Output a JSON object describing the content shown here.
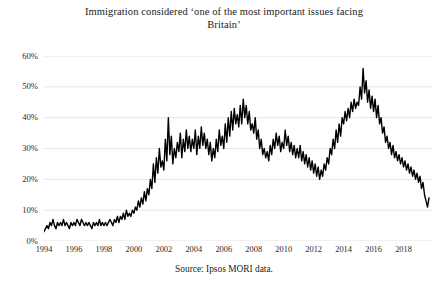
{
  "chart_data": {
    "type": "line",
    "title_line1": "Immigration considered ‘one of the most important issues facing",
    "title_line2": "Britain’",
    "source": "Source: Ipsos MORI data.",
    "xlabel": "",
    "ylabel": "",
    "xlim": [
      1994.0,
      2019.9
    ],
    "ylim": [
      0,
      60
    ],
    "grid": true,
    "legend": null,
    "series_color": "#000000",
    "grid_color": "#e3e3e3",
    "y_ticks": [
      0,
      10,
      20,
      30,
      40,
      50,
      60
    ],
    "y_tick_labels": [
      "0%",
      "10%",
      "20%",
      "30%",
      "40%",
      "50%",
      "60%"
    ],
    "x_ticks": [
      1994,
      1996,
      1998,
      2000,
      2002,
      2004,
      2006,
      2008,
      2010,
      2012,
      2014,
      2016,
      2018
    ],
    "x_tick_labels": [
      "1994",
      "1996",
      "1998",
      "2000",
      "2002",
      "2004",
      "2006",
      "2008",
      "2010",
      "2012",
      "2014",
      "2016",
      "2018"
    ],
    "series": [
      {
        "name": "Immigration as most important issue",
        "x": [
          1994.0,
          1994.1,
          1994.2,
          1994.3,
          1994.4,
          1994.5,
          1994.6,
          1994.7,
          1994.8,
          1994.9,
          1995.0,
          1995.1,
          1995.2,
          1995.3,
          1995.4,
          1995.5,
          1995.6,
          1995.7,
          1995.8,
          1995.9,
          1996.0,
          1996.1,
          1996.2,
          1996.3,
          1996.4,
          1996.5,
          1996.6,
          1996.7,
          1996.8,
          1996.9,
          1997.0,
          1997.1,
          1997.2,
          1997.3,
          1997.4,
          1997.5,
          1997.6,
          1997.7,
          1997.8,
          1997.9,
          1998.0,
          1998.1,
          1998.2,
          1998.3,
          1998.4,
          1998.5,
          1998.6,
          1998.7,
          1998.8,
          1998.9,
          1999.0,
          1999.1,
          1999.2,
          1999.3,
          1999.4,
          1999.5,
          1999.6,
          1999.7,
          1999.8,
          1999.9,
          2000.0,
          2000.1,
          2000.2,
          2000.3,
          2000.4,
          2000.5,
          2000.6,
          2000.7,
          2000.8,
          2000.9,
          2001.0,
          2001.1,
          2001.2,
          2001.3,
          2001.4,
          2001.5,
          2001.6,
          2001.7,
          2001.8,
          2001.9,
          2002.0,
          2002.1,
          2002.2,
          2002.3,
          2002.4,
          2002.5,
          2002.6,
          2002.7,
          2002.8,
          2002.9,
          2003.0,
          2003.1,
          2003.2,
          2003.3,
          2003.4,
          2003.5,
          2003.6,
          2003.7,
          2003.8,
          2003.9,
          2004.0,
          2004.1,
          2004.2,
          2004.3,
          2004.4,
          2004.5,
          2004.6,
          2004.7,
          2004.8,
          2004.9,
          2005.0,
          2005.1,
          2005.2,
          2005.3,
          2005.4,
          2005.5,
          2005.6,
          2005.7,
          2005.8,
          2005.9,
          2006.0,
          2006.1,
          2006.2,
          2006.3,
          2006.4,
          2006.5,
          2006.6,
          2006.7,
          2006.8,
          2006.9,
          2007.0,
          2007.1,
          2007.2,
          2007.3,
          2007.4,
          2007.5,
          2007.6,
          2007.7,
          2007.8,
          2007.9,
          2008.0,
          2008.1,
          2008.2,
          2008.3,
          2008.4,
          2008.5,
          2008.6,
          2008.7,
          2008.8,
          2008.9,
          2009.0,
          2009.1,
          2009.2,
          2009.3,
          2009.4,
          2009.5,
          2009.6,
          2009.7,
          2009.8,
          2009.9,
          2010.0,
          2010.1,
          2010.2,
          2010.3,
          2010.4,
          2010.5,
          2010.6,
          2010.7,
          2010.8,
          2010.9,
          2011.0,
          2011.1,
          2011.2,
          2011.3,
          2011.4,
          2011.5,
          2011.6,
          2011.7,
          2011.8,
          2011.9,
          2012.0,
          2012.1,
          2012.2,
          2012.3,
          2012.4,
          2012.5,
          2012.6,
          2012.7,
          2012.8,
          2012.9,
          2013.0,
          2013.1,
          2013.2,
          2013.3,
          2013.4,
          2013.5,
          2013.6,
          2013.7,
          2013.8,
          2013.9,
          2014.0,
          2014.1,
          2014.2,
          2014.3,
          2014.4,
          2014.5,
          2014.6,
          2014.7,
          2014.8,
          2014.9,
          2015.0,
          2015.1,
          2015.2,
          2015.3,
          2015.4,
          2015.5,
          2015.6,
          2015.7,
          2015.8,
          2015.9,
          2016.0,
          2016.1,
          2016.2,
          2016.3,
          2016.4,
          2016.5,
          2016.6,
          2016.7,
          2016.8,
          2016.9,
          2017.0,
          2017.1,
          2017.2,
          2017.3,
          2017.4,
          2017.5,
          2017.6,
          2017.7,
          2017.8,
          2017.9,
          2018.0,
          2018.1,
          2018.2,
          2018.3,
          2018.4,
          2018.5,
          2018.6,
          2018.7,
          2018.8,
          2018.9,
          2019.0,
          2019.1,
          2019.2,
          2019.3,
          2019.4,
          2019.5,
          2019.6,
          2019.7
        ],
        "values": [
          3,
          4,
          5,
          4,
          6,
          5,
          7,
          5,
          4,
          6,
          5,
          6,
          5,
          7,
          5,
          6,
          5,
          4,
          6,
          5,
          6,
          5,
          7,
          6,
          5,
          7,
          6,
          5,
          6,
          5,
          6,
          5,
          4,
          6,
          5,
          6,
          5,
          7,
          5,
          6,
          5,
          6,
          5,
          6,
          7,
          6,
          5,
          7,
          6,
          8,
          6,
          8,
          7,
          9,
          7,
          10,
          8,
          9,
          8,
          10,
          9,
          11,
          10,
          13,
          11,
          14,
          12,
          16,
          13,
          17,
          15,
          20,
          17,
          25,
          19,
          27,
          22,
          30,
          24,
          26,
          23,
          33,
          26,
          40,
          28,
          34,
          25,
          30,
          27,
          32,
          29,
          35,
          27,
          33,
          29,
          36,
          30,
          34,
          29,
          33,
          30,
          36,
          28,
          34,
          30,
          37,
          31,
          35,
          30,
          33,
          28,
          32,
          26,
          30,
          27,
          33,
          29,
          36,
          31,
          34,
          30,
          38,
          32,
          40,
          34,
          42,
          36,
          43,
          38,
          41,
          37,
          44,
          38,
          46,
          40,
          44,
          38,
          42,
          36,
          38,
          35,
          40,
          33,
          36,
          30,
          33,
          28,
          30,
          27,
          29,
          26,
          31,
          28,
          33,
          30,
          35,
          31,
          34,
          29,
          32,
          30,
          36,
          31,
          34,
          29,
          32,
          28,
          31,
          27,
          30,
          27,
          31,
          26,
          29,
          25,
          28,
          24,
          27,
          23,
          26,
          22,
          25,
          21,
          24,
          20,
          23,
          21,
          25,
          23,
          27,
          25,
          30,
          28,
          33,
          30,
          36,
          32,
          38,
          34,
          40,
          38,
          42,
          39,
          43,
          40,
          45,
          42,
          46,
          43,
          45,
          44,
          50,
          46,
          56,
          48,
          52,
          45,
          49,
          43,
          47,
          42,
          46,
          40,
          44,
          38,
          40,
          35,
          37,
          32,
          34,
          30,
          32,
          28,
          31,
          27,
          29,
          26,
          28,
          25,
          27,
          24,
          26,
          23,
          25,
          22,
          24,
          21,
          23,
          20,
          22,
          19,
          21,
          17,
          19,
          15,
          13,
          11,
          14
        ]
      }
    ]
  }
}
